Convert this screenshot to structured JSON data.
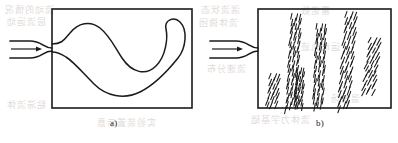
{
  "figure": {
    "kind": "scanned-textbook-figure",
    "background_color": "#ffffff",
    "ink_color": "#1b1b1b",
    "bleed_through_color": "#cfc6c1",
    "panels": [
      {
        "id": "a",
        "label": "a)",
        "label_x": 112,
        "label_y": 121,
        "box": {
          "x": 52,
          "y": 9,
          "width": 140,
          "height": 99
        },
        "inlet": {
          "type": "converging-nozzle-with-arrow",
          "arrow_label": "flow-direction-arrow",
          "arrow_x1": 11,
          "arrow_y1": 49,
          "arrow_x2": 36,
          "arrow_y2": 49,
          "upper_lip_y": 41,
          "lower_lip_y": 58,
          "pipe_start_x": 10
        },
        "filament": {
          "style": "continuous-smooth-band",
          "name": "laminar-dye-filament"
        }
      },
      {
        "id": "b",
        "label": "b)",
        "label_x": 318,
        "label_y": 121,
        "box": {
          "x": 258,
          "y": 9,
          "width": 133,
          "height": 99
        },
        "inlet": {
          "type": "converging-nozzle-with-arrow",
          "arrow_label": "flow-direction-arrow",
          "arrow_x1": 212,
          "arrow_y1": 49,
          "arrow_x2": 237,
          "arrow_y2": 49,
          "upper_lip_y": 41,
          "lower_lip_y": 58,
          "pipe_start_x": 210
        },
        "filament": {
          "style": "broken-dashed-streaks",
          "name": "turbulent-dye-fragments",
          "streak_clusters": [
            {
              "name": "cluster-left-low",
              "x": 272,
              "y": 74,
              "angle": -22,
              "dashes": 13,
              "spread": 9,
              "length": 14
            },
            {
              "name": "cluster-center-tall",
              "x": 293,
              "y": 14,
              "angle": -13,
              "dashes": 26,
              "spread": 9,
              "length": 14
            },
            {
              "name": "cluster-center-low",
              "x": 298,
              "y": 68,
              "angle": -12,
              "dashes": 11,
              "spread": 7,
              "length": 12
            },
            {
              "name": "cluster-mid",
              "x": 318,
              "y": 24,
              "angle": -10,
              "dashes": 22,
              "spread": 9,
              "length": 14
            },
            {
              "name": "cluster-right-tall",
              "x": 348,
              "y": 12,
              "angle": -20,
              "dashes": 22,
              "spread": 10,
              "length": 15
            },
            {
              "name": "cluster-far-right",
              "x": 372,
              "y": 38,
              "angle": -28,
              "dashes": 12,
              "spread": 10,
              "length": 14
            }
          ]
        }
      }
    ]
  },
  "bleed_through": {
    "note": "Faint mirrored text showing through from the reverse side of the scanned page; illegible in the image.",
    "fragments": [
      {
        "text": "流动的情况",
        "x": 4,
        "y": 3
      },
      {
        "text": "层流运动",
        "x": 6,
        "y": 15
      },
      {
        "text": "湍流状态",
        "x": 200,
        "y": 3
      },
      {
        "text": "流体微团",
        "x": 198,
        "y": 16
      },
      {
        "text": "雷诺数",
        "x": 300,
        "y": 4
      },
      {
        "text": "流速分布",
        "x": 206,
        "y": 62
      },
      {
        "text": "运动轨迹",
        "x": 300,
        "y": 40
      },
      {
        "text": "实验装置示意",
        "x": 96,
        "y": 116
      },
      {
        "text": "流体力学基础",
        "x": 250,
        "y": 113
      },
      {
        "text": "粘滞流体",
        "x": 6,
        "y": 98
      },
      {
        "text": "温度场",
        "x": 330,
        "y": 92
      }
    ]
  }
}
